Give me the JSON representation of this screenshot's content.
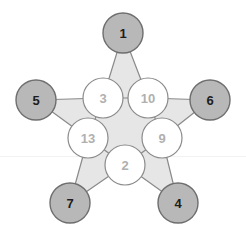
{
  "diagram": {
    "type": "magic-star",
    "title": "",
    "colors": {
      "outer_node_fill": "#b8b8b8",
      "outer_node_stroke": "#6e6e6e",
      "outer_node_text": "#1d1d1d",
      "inner_node_fill": "#ffffff",
      "inner_node_stroke": "#8a8a8a",
      "inner_node_text": "#b0b0b0",
      "star_fill": "#e6e6e6",
      "star_stroke": "#8a8a8a",
      "background": "#ffffff"
    },
    "outer_nodes": [
      {
        "id": "top",
        "label": "1",
        "cx": 123,
        "cy": 33,
        "r": 20
      },
      {
        "id": "left",
        "label": "5",
        "cx": 36,
        "cy": 100,
        "r": 20
      },
      {
        "id": "right",
        "label": "6",
        "cx": 210,
        "cy": 100,
        "r": 20
      },
      {
        "id": "bottom-left",
        "label": "7",
        "cx": 70,
        "cy": 203,
        "r": 20
      },
      {
        "id": "bottom-right",
        "label": "4",
        "cx": 178,
        "cy": 203,
        "r": 20
      }
    ],
    "inner_nodes": [
      {
        "id": "inner-upper-left",
        "label": "3",
        "cx": 103,
        "cy": 98,
        "r": 20
      },
      {
        "id": "inner-upper-right",
        "label": "10",
        "cx": 148,
        "cy": 98,
        "r": 20
      },
      {
        "id": "inner-left",
        "label": "13",
        "cx": 88,
        "cy": 138,
        "r": 20
      },
      {
        "id": "inner-right",
        "label": "9",
        "cx": 162,
        "cy": 138,
        "r": 20
      },
      {
        "id": "inner-bottom",
        "label": "2",
        "cx": 125,
        "cy": 165,
        "r": 20
      }
    ],
    "edges": [
      {
        "from": "1",
        "to": "3"
      },
      {
        "from": "1",
        "to": "10"
      },
      {
        "from": "5",
        "to": "3"
      },
      {
        "from": "5",
        "to": "13"
      },
      {
        "from": "6",
        "to": "10"
      },
      {
        "from": "6",
        "to": "9"
      },
      {
        "from": "7",
        "to": "13"
      },
      {
        "from": "7",
        "to": "2"
      },
      {
        "from": "4",
        "to": "9"
      },
      {
        "from": "4",
        "to": "2"
      },
      {
        "from": "3",
        "to": "10"
      },
      {
        "from": "3",
        "to": "13"
      },
      {
        "from": "10",
        "to": "9"
      },
      {
        "from": "13",
        "to": "2"
      },
      {
        "from": "9",
        "to": "2"
      }
    ]
  }
}
